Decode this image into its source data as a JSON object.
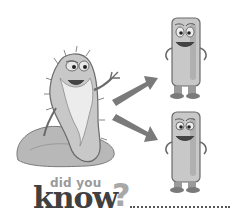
{
  "title": {
    "line1": "did you",
    "line2": "know",
    "punctuation": "?"
  },
  "illustration": {
    "parent_cell": "old bearded bacterium sitting on rock",
    "arrows": 2,
    "daughter_cells": 2
  },
  "colors": {
    "background": "#ffffff",
    "cell_fill": "#c8c8c8",
    "cell_outline": "#6a6a6a",
    "arrow": "#7a7a7a",
    "title_dark": "#404040",
    "title_light": "#9a9a9a"
  }
}
